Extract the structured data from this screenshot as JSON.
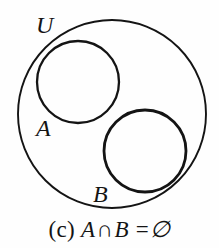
{
  "figure": {
    "type": "venn-diagram",
    "title_caption": "(c) A ∩ B = ∅",
    "background_color": "#fefefe",
    "stroke_color": "#141414",
    "universal_set": {
      "label": "U",
      "cx": 112,
      "cy": 114,
      "r": 94
    },
    "sets": [
      {
        "label": "A",
        "cx": 78,
        "cy": 82,
        "r": 41,
        "label_x": 36,
        "label_y": 136
      },
      {
        "label": "B",
        "cx": 145,
        "cy": 151,
        "r": 41,
        "label_x": 93,
        "label_y": 202
      }
    ],
    "universal_label_x": 36,
    "universal_label_y": 33,
    "relation": "disjoint",
    "caption": {
      "index": "(c)",
      "set_a": "A",
      "operator": "∩",
      "set_b": "B",
      "equals": "=",
      "result": "∅"
    }
  }
}
